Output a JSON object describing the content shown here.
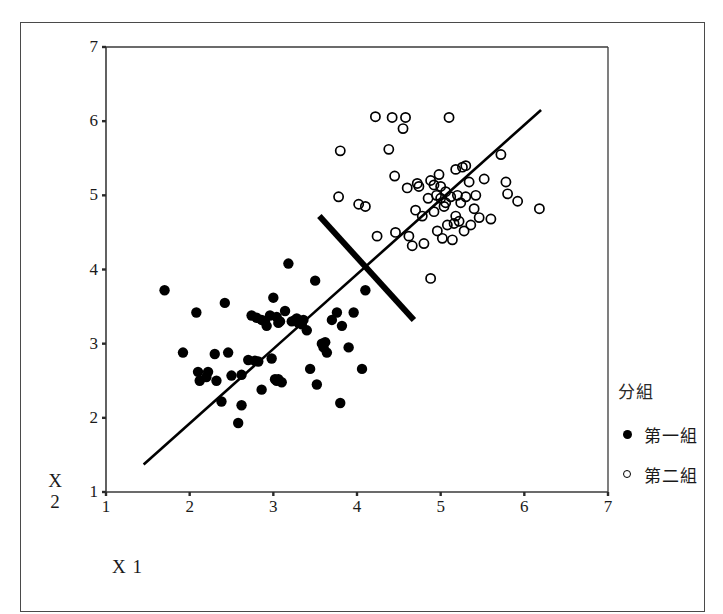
{
  "chart_data": {
    "type": "scatter",
    "title": "",
    "xlabel": "X 1",
    "ylabel": "X 2",
    "xlim": [
      1,
      7
    ],
    "ylim": [
      1,
      7
    ],
    "xticks": [
      1,
      2,
      3,
      4,
      5,
      6,
      7
    ],
    "yticks": [
      1,
      2,
      3,
      4,
      5,
      6,
      7
    ],
    "grid": false,
    "legend_position": "right",
    "legend_title": "分組",
    "series": [
      {
        "name": "第一組",
        "marker": "filled-circle",
        "color": "#000000",
        "points": [
          [
            1.7,
            3.72
          ],
          [
            1.92,
            2.88
          ],
          [
            2.08,
            3.42
          ],
          [
            2.1,
            2.62
          ],
          [
            2.12,
            2.5
          ],
          [
            2.2,
            2.55
          ],
          [
            2.22,
            2.62
          ],
          [
            2.3,
            2.86
          ],
          [
            2.32,
            2.5
          ],
          [
            2.38,
            2.22
          ],
          [
            2.42,
            3.55
          ],
          [
            2.46,
            2.88
          ],
          [
            2.5,
            2.57
          ],
          [
            2.58,
            1.93
          ],
          [
            2.62,
            2.17
          ],
          [
            2.7,
            2.78
          ],
          [
            2.74,
            3.38
          ],
          [
            2.78,
            2.77
          ],
          [
            2.8,
            3.35
          ],
          [
            2.82,
            2.76
          ],
          [
            2.86,
            2.38
          ],
          [
            2.9,
            3.3
          ],
          [
            2.92,
            3.24
          ],
          [
            2.96,
            3.38
          ],
          [
            2.98,
            2.8
          ],
          [
            3.0,
            3.62
          ],
          [
            3.02,
            2.52
          ],
          [
            3.04,
            2.5
          ],
          [
            3.06,
            3.28
          ],
          [
            3.08,
            3.3
          ],
          [
            3.1,
            2.48
          ],
          [
            3.14,
            3.44
          ],
          [
            3.18,
            4.08
          ],
          [
            3.22,
            3.3
          ],
          [
            3.26,
            3.32
          ],
          [
            3.3,
            3.28
          ],
          [
            3.32,
            3.3
          ],
          [
            3.34,
            3.26
          ],
          [
            3.36,
            3.32
          ],
          [
            3.4,
            3.18
          ],
          [
            3.44,
            2.66
          ],
          [
            3.5,
            3.85
          ],
          [
            3.52,
            2.45
          ],
          [
            3.58,
            3.0
          ],
          [
            3.6,
            2.95
          ],
          [
            3.62,
            3.02
          ],
          [
            3.64,
            2.88
          ],
          [
            3.7,
            3.32
          ],
          [
            3.76,
            3.42
          ],
          [
            3.8,
            2.2
          ],
          [
            3.82,
            3.24
          ],
          [
            3.9,
            2.95
          ],
          [
            3.96,
            3.42
          ],
          [
            4.06,
            2.66
          ],
          [
            4.1,
            3.72
          ],
          [
            2.62,
            2.58
          ],
          [
            3.04,
            3.36
          ],
          [
            3.28,
            3.34
          ],
          [
            2.86,
            3.32
          ],
          [
            3.06,
            2.52
          ]
        ]
      },
      {
        "name": "第二組",
        "marker": "open-circle",
        "color": "#000000",
        "points": [
          [
            3.8,
            5.6
          ],
          [
            3.78,
            4.98
          ],
          [
            4.22,
            6.06
          ],
          [
            4.1,
            4.85
          ],
          [
            4.02,
            4.88
          ],
          [
            4.24,
            4.45
          ],
          [
            4.45,
            5.26
          ],
          [
            4.42,
            6.05
          ],
          [
            4.58,
            6.05
          ],
          [
            4.55,
            5.9
          ],
          [
            4.38,
            5.62
          ],
          [
            4.6,
            5.1
          ],
          [
            4.62,
            4.45
          ],
          [
            4.66,
            4.32
          ],
          [
            4.72,
            5.16
          ],
          [
            4.74,
            5.12
          ],
          [
            4.78,
            4.72
          ],
          [
            4.8,
            4.35
          ],
          [
            4.85,
            4.96
          ],
          [
            4.88,
            5.2
          ],
          [
            4.88,
            3.88
          ],
          [
            4.92,
            4.78
          ],
          [
            4.95,
            5.0
          ],
          [
            4.96,
            4.52
          ],
          [
            4.98,
            5.28
          ],
          [
            5.0,
            4.96
          ],
          [
            5.02,
            4.42
          ],
          [
            5.04,
            4.85
          ],
          [
            5.06,
            5.05
          ],
          [
            5.08,
            4.6
          ],
          [
            5.1,
            6.05
          ],
          [
            5.12,
            4.98
          ],
          [
            5.14,
            4.4
          ],
          [
            5.16,
            4.62
          ],
          [
            5.18,
            5.35
          ],
          [
            5.2,
            5.0
          ],
          [
            5.22,
            4.65
          ],
          [
            5.24,
            4.9
          ],
          [
            5.26,
            5.38
          ],
          [
            5.28,
            4.52
          ],
          [
            5.3,
            5.4
          ],
          [
            5.34,
            5.18
          ],
          [
            5.4,
            4.82
          ],
          [
            5.42,
            5.0
          ],
          [
            5.46,
            4.7
          ],
          [
            5.52,
            5.22
          ],
          [
            5.6,
            4.68
          ],
          [
            5.72,
            5.55
          ],
          [
            5.78,
            5.18
          ],
          [
            5.8,
            5.02
          ],
          [
            5.92,
            4.92
          ],
          [
            6.18,
            4.82
          ],
          [
            4.92,
            5.14
          ],
          [
            5.06,
            4.9
          ],
          [
            5.18,
            4.72
          ],
          [
            4.7,
            4.8
          ],
          [
            5.0,
            5.12
          ],
          [
            5.3,
            4.98
          ],
          [
            4.46,
            4.5
          ],
          [
            5.36,
            4.6
          ]
        ]
      }
    ],
    "annotations": [
      {
        "name": "discriminant-axis-line",
        "style": "thin",
        "from": [
          1.45,
          1.37
        ],
        "to": [
          6.2,
          6.15
        ]
      },
      {
        "name": "classification-boundary-line",
        "style": "thick",
        "from": [
          3.55,
          4.72
        ],
        "to": [
          4.68,
          3.32
        ]
      }
    ]
  },
  "axes": {
    "x_tick_labels": [
      "1",
      "2",
      "3",
      "4",
      "5",
      "6",
      "7"
    ],
    "y_tick_labels": [
      "1",
      "2",
      "3",
      "4",
      "5",
      "6",
      "7"
    ],
    "x_title": "X 1",
    "y_title_line1": "X",
    "y_title_line2": "2"
  },
  "legend": {
    "title": "分組",
    "items": [
      {
        "label": "第一組",
        "marker": "filled-circle"
      },
      {
        "label": "第二組",
        "marker": "open-circle"
      }
    ]
  }
}
